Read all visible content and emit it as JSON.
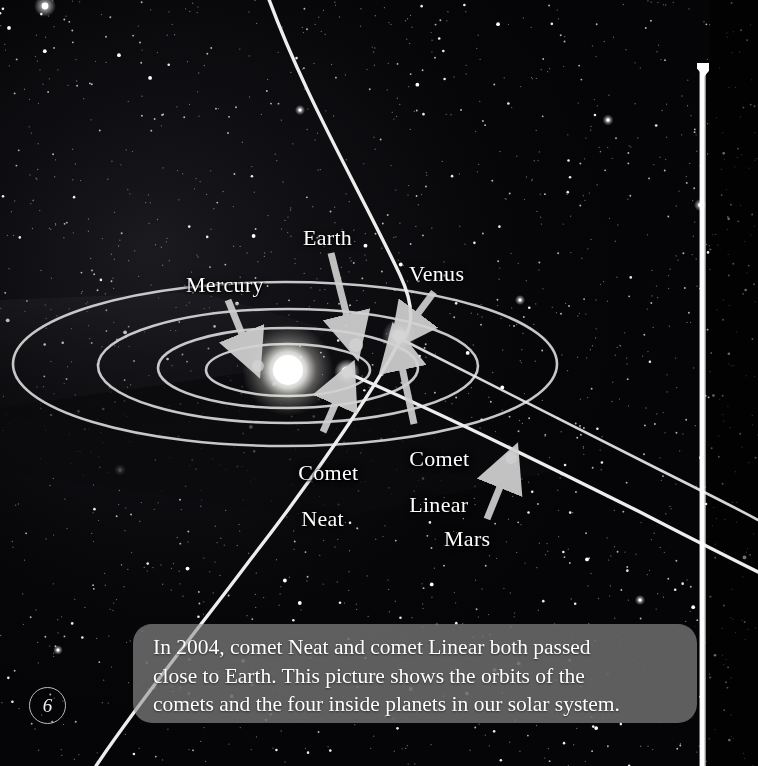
{
  "page": {
    "number": "6",
    "kind": "illustrated-book-page",
    "background_color": "#050507"
  },
  "illustration": {
    "title_object": "solar-system-with-comet-orbits",
    "sun": {
      "name": "Sun",
      "x": 288,
      "y": 370,
      "color": "#ffffff"
    },
    "bodies": [
      {
        "name": "Mercury",
        "label": "Mercury",
        "x": 258,
        "y": 366,
        "radius": 6,
        "color": "#b9b9b9",
        "label_x": 186,
        "label_y": 275,
        "arrow": {
          "x1": 228,
          "y1": 300,
          "x2": 250,
          "y2": 356
        }
      },
      {
        "name": "Earth",
        "label": "Earth",
        "x": 356,
        "y": 345,
        "radius": 7,
        "color": "#a9a9a9",
        "label_x": 303,
        "label_y": 228,
        "arrow": {
          "x1": 331,
          "y1": 253,
          "x2": 352,
          "y2": 338
        }
      },
      {
        "name": "Venus",
        "label": "Venus",
        "x": 399,
        "y": 336,
        "radius": 6,
        "color": "#ffffff",
        "label_x": 409,
        "label_y": 264,
        "arrow": {
          "x1": 432,
          "y1": 292,
          "x2": 404,
          "y2": 333
        }
      },
      {
        "name": "Mars",
        "label": "Mars",
        "x": 511,
        "y": 458,
        "radius": 6,
        "color": "#9a9a9a",
        "label_x": 444,
        "label_y": 528,
        "arrow": {
          "x1": 487,
          "y1": 519,
          "x2": 508,
          "y2": 466
        }
      }
    ],
    "comets": [
      {
        "name": "Comet Neat",
        "label_line1": "Comet",
        "label_line2": "Neat",
        "x": 347,
        "y": 372,
        "radius": 5,
        "color": "#ffffff",
        "label_x": 281,
        "label_y": 440,
        "arrow": {
          "x1": 323,
          "y1": 432,
          "x2": 344,
          "y2": 382
        }
      },
      {
        "name": "Comet Linear",
        "label_line1": "Comet",
        "label_line2": "Linear",
        "x": 399,
        "y": 336,
        "radius": 5,
        "color": "#ffffff",
        "label_x": 389,
        "label_y": 426,
        "arrow": {
          "x1": 414,
          "y1": 424,
          "x2": 398,
          "y2": 345
        }
      }
    ],
    "orbits": [
      {
        "body": "Mercury",
        "rx": 82,
        "ry": 26
      },
      {
        "body": "Venus",
        "rx": 130,
        "ry": 40
      },
      {
        "body": "Earth",
        "rx": 190,
        "ry": 57
      },
      {
        "body": "Mars",
        "rx": 272,
        "ry": 82
      }
    ],
    "comet_paths": [
      {
        "name": "comet-orbit-upper",
        "description": "long arc sweeping from top of frame down to the inner system"
      },
      {
        "name": "comet-orbit-lower",
        "description": "long arc descending to the lower-left of the frame"
      },
      {
        "name": "comet-orbit-diagonal",
        "description": "straight-looking path crossing to the lower-right corner"
      }
    ]
  },
  "caption": {
    "line1": "In 2004, comet Neat and comet Linear both passed",
    "line2": "close to Earth. This picture shows the orbits of the",
    "line3": "comets and the four inside planets in our solar system.",
    "background_color": "#969696",
    "text_color": "#ffffff"
  }
}
